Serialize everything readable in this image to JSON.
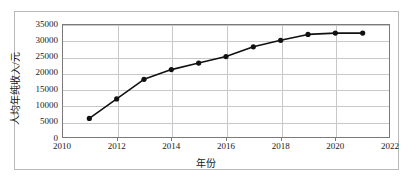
{
  "chart_data": {
    "type": "line",
    "title": "",
    "xlabel": "年份",
    "ylabel": "人均年纯收入/元",
    "x": [
      2011,
      2012,
      2013,
      2014,
      2015,
      2016,
      2017,
      2018,
      2019,
      2020,
      2021
    ],
    "values": [
      6000,
      12000,
      18000,
      21000,
      23000,
      25000,
      28000,
      30000,
      31800,
      32200,
      32200
    ],
    "series": [
      {
        "name": "人均年纯收入",
        "values": [
          6000,
          12000,
          18000,
          21000,
          23000,
          25000,
          28000,
          30000,
          31800,
          32200,
          32200
        ]
      }
    ],
    "xlim": [
      2010,
      2022
    ],
    "ylim": [
      0,
      35000
    ],
    "xticks": [
      2010,
      2012,
      2014,
      2016,
      2018,
      2020,
      2022
    ],
    "xtick_labels": [
      "2010",
      "2012",
      "2014",
      "2016",
      "2018",
      "2020",
      "2022"
    ],
    "yticks": [
      0,
      5000,
      10000,
      15000,
      20000,
      25000,
      30000,
      35000
    ],
    "ytick_labels": [
      "0",
      "5000",
      "10000",
      "15000",
      "20000",
      "25000",
      "30000",
      "35000"
    ],
    "grid": true,
    "legend": "none",
    "marker": "filled-circle",
    "line_color": "#111111",
    "marker_color": "#111111",
    "grid_color": "#c8c8c8",
    "frame_color": "#7a7a7a"
  }
}
